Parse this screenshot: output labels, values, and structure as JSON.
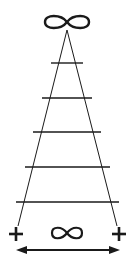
{
  "diagram": {
    "top_symbol": "∞",
    "bottom_symbol": "∞",
    "left_symbol": "+",
    "right_symbol": "+",
    "rung_count": 5,
    "stroke_color": "#1a1a1a",
    "background": "#ffffff"
  }
}
